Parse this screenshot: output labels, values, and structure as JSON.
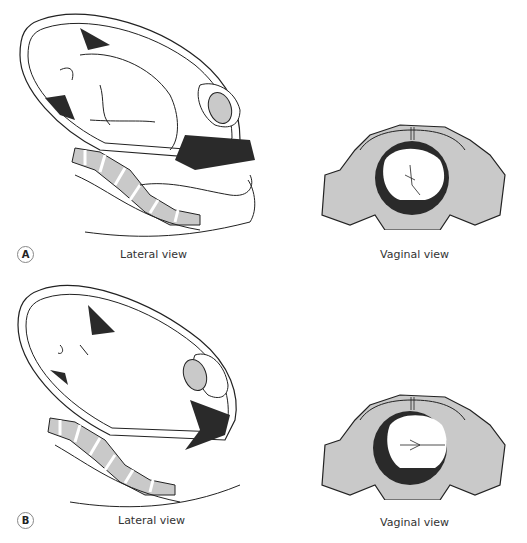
{
  "figure": {
    "panels": [
      {
        "label": "A",
        "lateral_caption": "Lateral view",
        "vaginal_caption": "Vaginal view"
      },
      {
        "label": "B",
        "lateral_caption": "Lateral view",
        "vaginal_caption": "Vaginal view"
      }
    ],
    "colors": {
      "outline": "#222222",
      "bone": "#c9c9c9",
      "dark": "#2a2a2a",
      "fill": "#ffffff"
    }
  }
}
